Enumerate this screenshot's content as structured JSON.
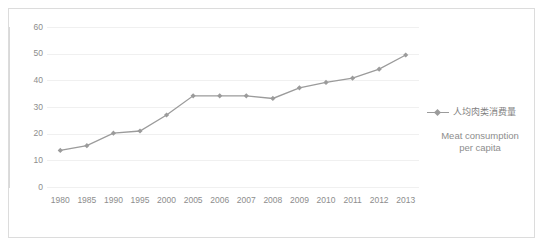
{
  "chart_data": {
    "type": "line",
    "title": "",
    "xlabel": "",
    "ylabel": "",
    "ylim": [
      0,
      60
    ],
    "yticks": [
      0,
      10,
      20,
      30,
      40,
      50,
      60
    ],
    "grid": true,
    "legend_position": "right",
    "categories": [
      "1980",
      "1985",
      "1990",
      "1995",
      "2000",
      "2005",
      "2006",
      "2007",
      "2008",
      "2009",
      "2010",
      "2011",
      "2012",
      "2013"
    ],
    "series": [
      {
        "name": "人均肉类消费量",
        "name_en": "Meat consumption per capita",
        "color": "#9b9b9b",
        "marker": "diamond",
        "values": [
          13.7,
          15.5,
          20.2,
          21.0,
          27.0,
          34.2,
          34.2,
          34.2,
          33.2,
          37.2,
          39.2,
          40.8,
          44.2,
          49.5
        ]
      }
    ]
  },
  "legend": {
    "series_label_cn": "人均肉类消费量",
    "caption_line1": "Meat consumption",
    "caption_line2": "per capita"
  },
  "colors": {
    "series": "#9b9b9b",
    "grid": "#f0f0f0",
    "axis": "#d9d9d9",
    "border": "#dcdcdc",
    "text": "#8d8d8d",
    "background": "#ffffff"
  }
}
